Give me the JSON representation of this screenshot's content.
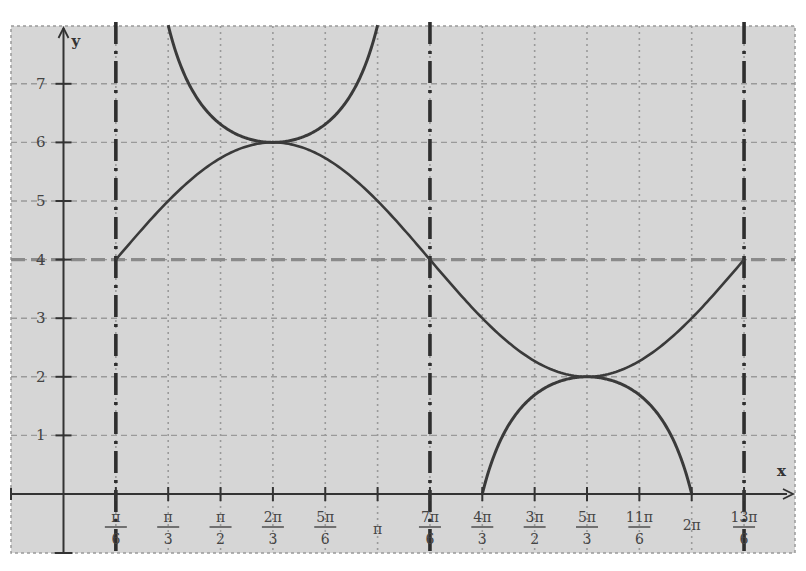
{
  "chart_data": {
    "type": "line",
    "title": "",
    "xlabel": "x",
    "ylabel": "y",
    "xlim_in_pi_sixths": [
      -1.0,
      14.0
    ],
    "ylim": [
      -1.0,
      7.9
    ],
    "grid": true,
    "x_ticks": [
      {
        "value_pi_sixths": 1,
        "num": "π",
        "den": "6"
      },
      {
        "value_pi_sixths": 2,
        "num": "π",
        "den": "3"
      },
      {
        "value_pi_sixths": 3,
        "num": "π",
        "den": "2"
      },
      {
        "value_pi_sixths": 4,
        "num": "2π",
        "den": "3"
      },
      {
        "value_pi_sixths": 5,
        "num": "5π",
        "den": "6"
      },
      {
        "value_pi_sixths": 6,
        "num": "π",
        "den": ""
      },
      {
        "value_pi_sixths": 7,
        "num": "7π",
        "den": "6"
      },
      {
        "value_pi_sixths": 8,
        "num": "4π",
        "den": "3"
      },
      {
        "value_pi_sixths": 9,
        "num": "3π",
        "den": "2"
      },
      {
        "value_pi_sixths": 10,
        "num": "5π",
        "den": "3"
      },
      {
        "value_pi_sixths": 11,
        "num": "11π",
        "den": "6"
      },
      {
        "value_pi_sixths": 12,
        "num": "2π",
        "den": ""
      },
      {
        "value_pi_sixths": 13,
        "num": "13π",
        "den": "6"
      }
    ],
    "y_ticks": [
      1,
      2,
      3,
      4,
      5,
      6,
      7
    ],
    "series": [
      {
        "name": "sine",
        "formula": "y = 4 + 2 sin(x - π/6)",
        "style": "solid",
        "key_points": [
          [
            1,
            4
          ],
          [
            4,
            6
          ],
          [
            7,
            4
          ],
          [
            10,
            2
          ],
          [
            13,
            4
          ]
        ]
      },
      {
        "name": "cosecant",
        "formula": "y = 4 + 2 csc(x - π/6)",
        "style": "solid",
        "key_points": [
          [
            2,
            8
          ],
          [
            4,
            6
          ],
          [
            6,
            8
          ],
          [
            8,
            0
          ],
          [
            10,
            2
          ],
          [
            12,
            0
          ]
        ]
      },
      {
        "name": "midline",
        "formula": "y = 4",
        "style": "dashed"
      }
    ],
    "asymptotes_pi_sixths": [
      1,
      7,
      13
    ],
    "colors": {
      "background": "#d6d6d6",
      "grid": "#9a9a9a",
      "axis": "#333333",
      "curve": "#3a3a3a",
      "midline": "#8a8a8a",
      "asymptote": "#2e2e2e"
    }
  }
}
